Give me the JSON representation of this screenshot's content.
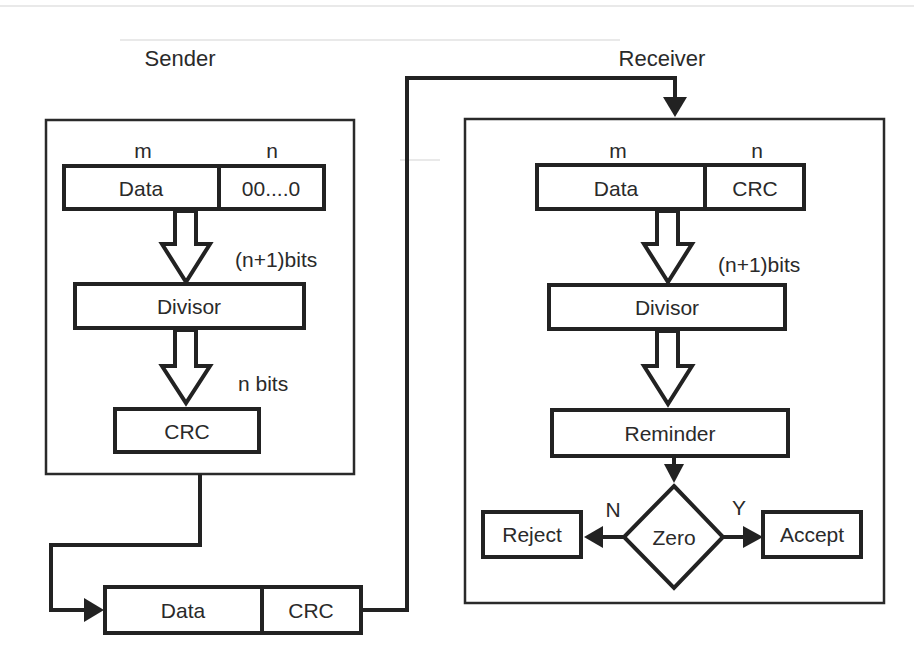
{
  "diagram": {
    "colors": {
      "background": "#ffffff",
      "stroke": "#222222",
      "text": "#2a2a2a"
    },
    "sender": {
      "label": "Sender",
      "field_labels": {
        "m": "m",
        "n": "n"
      },
      "frame_row": {
        "data": "Data",
        "padding": "00....0"
      },
      "arrow1_label": "(n+1)bits",
      "divisor": "Divisor",
      "arrow2_label": "n bits",
      "crc": "CRC"
    },
    "transmitted_frame": {
      "data": "Data",
      "crc": "CRC"
    },
    "receiver": {
      "label": "Receiver",
      "field_labels": {
        "m": "m",
        "n": "n"
      },
      "frame_row": {
        "data": "Data",
        "crc": "CRC"
      },
      "arrow1_label": "(n+1)bits",
      "divisor": "Divisor",
      "remainder": "Reminder",
      "decision": "Zero",
      "no_label": "N",
      "yes_label": "Y",
      "reject": "Reject",
      "accept": "Accept"
    }
  }
}
